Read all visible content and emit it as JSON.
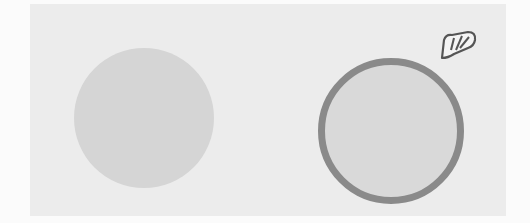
{
  "canvas": {
    "background_color": "#ececec",
    "bleed_text": ""
  },
  "shapes": [
    {
      "name": "plain-circle",
      "fill": "#d5d5d5",
      "selected": false
    },
    {
      "name": "selected-circle",
      "fill": "#d9d9d9",
      "stroke": "#8a8a8a",
      "selected": true
    }
  ],
  "cursor": {
    "icon": "hand-cursor-icon"
  }
}
